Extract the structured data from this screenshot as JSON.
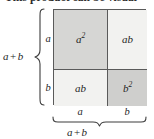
{
  "figure": {
    "title_fragment": "This product can be visual",
    "square": {
      "cells": [
        {
          "id": "top-left",
          "base": "a",
          "exponent": "2",
          "label": "a²",
          "fill": "#d6d6d4"
        },
        {
          "id": "top-right",
          "base": "ab",
          "exponent": "",
          "label": "ab",
          "fill": "#f2f2f0"
        },
        {
          "id": "bottom-left",
          "base": "ab",
          "exponent": "",
          "label": "ab",
          "fill": "#f2f2f0"
        },
        {
          "id": "bottom-right",
          "base": "b",
          "exponent": "2",
          "label": "b²",
          "fill": "#cfcfcd"
        }
      ],
      "border_color": "#5a5a5a"
    },
    "left_side": {
      "segment_top_label": "a",
      "segment_bottom_label": "b",
      "total_label_left": "a",
      "total_label_op": "+",
      "total_label_right": "b"
    },
    "bottom_side": {
      "segment_left_label": "a",
      "segment_right_label": "b",
      "total_label_left": "a",
      "total_label_op": "+",
      "total_label_right": "b"
    },
    "brace_color": "#3d3d3d"
  }
}
